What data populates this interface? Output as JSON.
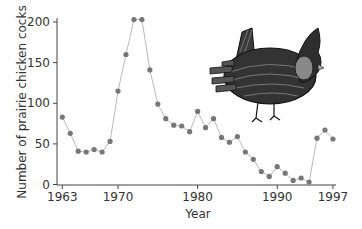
{
  "chart_data": {
    "type": "line",
    "title": "",
    "xlabel": "Year",
    "ylabel": "Number of prairie chicken cocks",
    "xlim": [
      1963,
      1997
    ],
    "ylim": [
      0,
      200
    ],
    "x_ticks": [
      1963,
      1970,
      1980,
      1990,
      1997
    ],
    "y_ticks": [
      0,
      50,
      100,
      150,
      200
    ],
    "grid": false,
    "legend": null,
    "x": [
      1963,
      1964,
      1965,
      1966,
      1967,
      1968,
      1969,
      1970,
      1971,
      1972,
      1973,
      1974,
      1975,
      1976,
      1977,
      1978,
      1979,
      1980,
      1981,
      1982,
      1983,
      1984,
      1985,
      1986,
      1987,
      1988,
      1989,
      1990,
      1991,
      1992,
      1993,
      1994,
      1995,
      1996,
      1997
    ],
    "series": [
      {
        "name": "Prairie chicken cocks",
        "values": [
          83,
          63,
          41,
          40,
          43,
          40,
          53,
          115,
          160,
          203,
          203,
          141,
          99,
          81,
          73,
          72,
          65,
          90,
          70,
          81,
          58,
          52,
          59,
          40,
          31,
          16,
          10,
          22,
          14,
          5,
          8,
          3,
          57,
          67,
          56
        ]
      }
    ],
    "annotations": [
      "illustration of a greater prairie chicken (upper right)"
    ],
    "colors": {
      "marker": "#777777",
      "line": "#bbbbbb",
      "axis": "#444444"
    }
  },
  "axes": {
    "x_title": "Year",
    "y_title": "Number of prairie chicken cocks",
    "x_tick_labels": [
      "1963",
      "1970",
      "1980",
      "1990",
      "1997"
    ],
    "y_tick_labels": [
      "0",
      "50",
      "100",
      "150",
      "200"
    ]
  },
  "illustration": {
    "icon": "prairie-chicken-icon"
  }
}
